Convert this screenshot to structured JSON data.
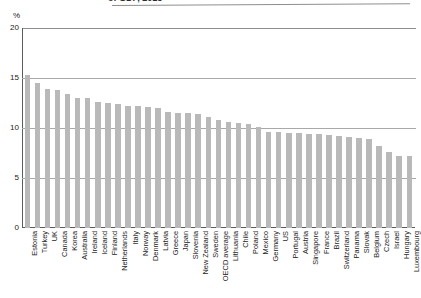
{
  "figure": {
    "unit_label": "%",
    "title_clipped": "of GDP, 2015"
  },
  "axis": {
    "y_ticks": [
      "20",
      "15",
      "10",
      "5",
      "0"
    ],
    "y_tick_values": [
      20,
      15,
      10,
      5,
      0
    ]
  },
  "colors": {
    "bar_fill": "#b9b9b9",
    "axis_line": "#5c5c5c",
    "grid_line": "#a9a9a9",
    "text": "#1a1a1a"
  },
  "chart_data": {
    "type": "bar",
    "title": "of GDP, 2015",
    "xlabel": "",
    "ylabel": "%",
    "ylim": [
      0,
      20
    ],
    "yticks": [
      0,
      5,
      10,
      15,
      20
    ],
    "grid": true,
    "legend": "none",
    "orientation": "vertical",
    "sorted": "descending",
    "categories": [
      "Estonia",
      "Turkey",
      "UK",
      "Canada",
      "Korea",
      "Australia",
      "Ireland",
      "Iceland",
      "Finland",
      "Netherlands",
      "Italy",
      "Norway",
      "Denmark",
      "Latvia",
      "Greece",
      "Japan",
      "Slovenia",
      "New Zealand",
      "Sweden",
      "OECD average",
      "Lithuania",
      "Chile",
      "Poland",
      "Mexico",
      "Germany",
      "US",
      "Portugal",
      "Austria",
      "Singapore",
      "France",
      "Brazil",
      "Switzerland",
      "Panama",
      "Slovak",
      "Belgium",
      "Czech",
      "Israel",
      "Hungary",
      "Luxembourg"
    ],
    "values": [
      15.3,
      14.5,
      13.9,
      13.8,
      13.4,
      13.0,
      13.0,
      12.6,
      12.5,
      12.4,
      12.2,
      12.2,
      12.1,
      12.0,
      11.6,
      11.5,
      11.5,
      11.4,
      11.1,
      10.8,
      10.6,
      10.5,
      10.4,
      10.1,
      9.6,
      9.6,
      9.5,
      9.5,
      9.4,
      9.4,
      9.3,
      9.2,
      9.1,
      9.0,
      8.9,
      8.2,
      7.6,
      7.2,
      7.2
    ]
  }
}
